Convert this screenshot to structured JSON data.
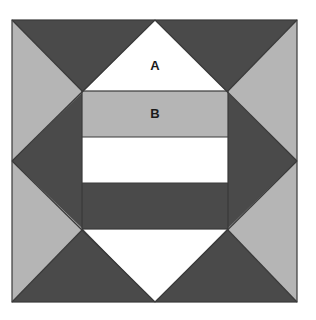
{
  "figure": {
    "name": "geometric-quilt-block-figure",
    "canvas": {
      "width": 316,
      "height": 320,
      "background": "#ffffff"
    },
    "outer_square": {
      "name": "outer-square",
      "x": 12,
      "y": 20,
      "width": 285,
      "height": 282,
      "stroke": "#3a3a3a",
      "stroke_width": 1
    },
    "colors": {
      "light_gray": "#b5b5b5",
      "dark_gray": "#4a4a4a",
      "white": "#ffffff",
      "outline": "#3a3a3a",
      "label_text": "#1a1a1a"
    },
    "diamond": {
      "name": "central-diamond",
      "top_vertex": [
        155,
        20
      ],
      "left_vertex": [
        12,
        161
      ],
      "right_vertex": [
        297,
        161
      ],
      "bottom_vertex": [
        155,
        302
      ]
    },
    "corner_triangles": [
      {
        "name": "corner-top-left",
        "color": "#b5b5b5",
        "points": "12,20 155,20 12,161"
      },
      {
        "name": "corner-top-right",
        "color": "#b5b5b5",
        "points": "155,20 297,20 297,161"
      },
      {
        "name": "corner-bottom-right",
        "color": "#b5b5b5",
        "points": "297,161 297,302 155,302"
      },
      {
        "name": "corner-bottom-left",
        "color": "#b5b5b5",
        "points": "12,161 155,302 12,302"
      }
    ],
    "dark_triangles": [
      {
        "name": "dark-wedge-top",
        "color": "#4a4a4a",
        "points": "12,20 155,20 83,92"
      },
      {
        "name": "dark-wedge-top-right",
        "color": "#4a4a4a",
        "points": "155,20 297,20 227,92"
      },
      {
        "name": "dark-wedge-left",
        "color": "#4a4a4a",
        "points": "12,20 83,92 83,229 12,302 12,161"
      },
      {
        "name": "dark-wedge-right",
        "color": "#4a4a4a",
        "points": "297,20 227,92 227,229 297,302 297,161"
      },
      {
        "name": "dark-wedge-bottom-left",
        "color": "#4a4a4a",
        "points": "12,302 83,229 155,302"
      },
      {
        "name": "dark-wedge-bottom-right",
        "color": "#4a4a4a",
        "points": "297,302 227,229 155,302"
      }
    ],
    "white_triangles": [
      {
        "name": "white-triangle-a",
        "color": "#ffffff",
        "points": "155,20 227,92 83,92",
        "label": "A"
      },
      {
        "name": "white-triangle-bottom",
        "color": "#ffffff",
        "points": "83,229 227,229 155,302",
        "label": ""
      }
    ],
    "center_rect": {
      "name": "center-striped-rectangle",
      "x": 82,
      "y": 91,
      "width": 146,
      "height": 138,
      "bands": [
        {
          "name": "band-b-light",
          "label": "B",
          "color": "#b5b5b5",
          "y": 91,
          "height": 46
        },
        {
          "name": "band-white",
          "label": "",
          "color": "#ffffff",
          "y": 137,
          "height": 46
        },
        {
          "name": "band-dark",
          "label": "",
          "color": "#4a4a4a",
          "y": 183,
          "height": 46
        }
      ]
    },
    "labels": [
      {
        "name": "label-a",
        "text": "A",
        "x": 155,
        "y": 66
      },
      {
        "name": "label-b",
        "text": "B",
        "x": 155,
        "y": 114
      }
    ]
  }
}
